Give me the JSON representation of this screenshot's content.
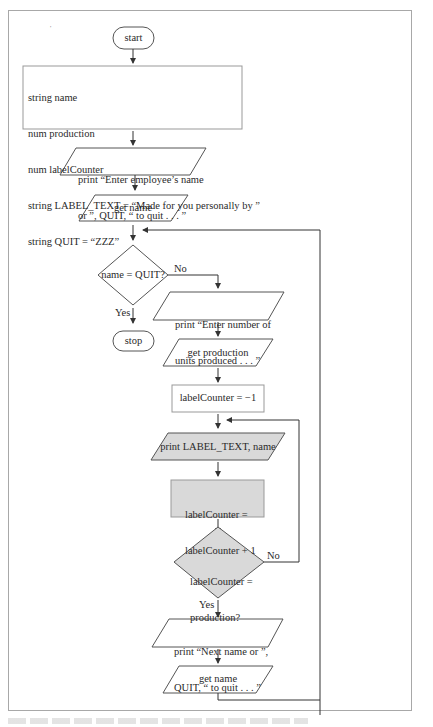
{
  "diagram": {
    "type": "flowchart",
    "stray_mark": "'",
    "nodes": {
      "start": "start",
      "declarations": [
        "string name",
        "num production",
        "num labelCounter",
        "string LABEL_TEXT = “Made for you personally by ”",
        "string QUIT = “ZZZ”"
      ],
      "prompt_name": [
        "print “Enter employee’s name",
        "or ”, QUIT, “ to quit . . . ”"
      ],
      "get_name_1": "get name",
      "decision_quit": "name = QUIT?",
      "stop": "stop",
      "prompt_units": [
        "print “Enter number of",
        "units produced . . . ”"
      ],
      "get_production": "get production",
      "init_counter": "labelCounter = −1",
      "print_label": "print LABEL_TEXT, name",
      "increment": [
        "labelCounter =",
        "labelCounter + 1"
      ],
      "decision_count": [
        "labelCounter =",
        "production?"
      ],
      "prompt_next": [
        "print “Next name or ”,",
        "QUIT, “ to quit . . . ”"
      ],
      "get_name_2": "get name"
    },
    "edge_labels": {
      "quit_no": "No",
      "quit_yes": "Yes",
      "count_no": "No",
      "count_yes": "Yes"
    },
    "colors": {
      "line": "#333333",
      "shaded_fill": "#d9d9d9",
      "frame": "#a8a8a8"
    }
  }
}
